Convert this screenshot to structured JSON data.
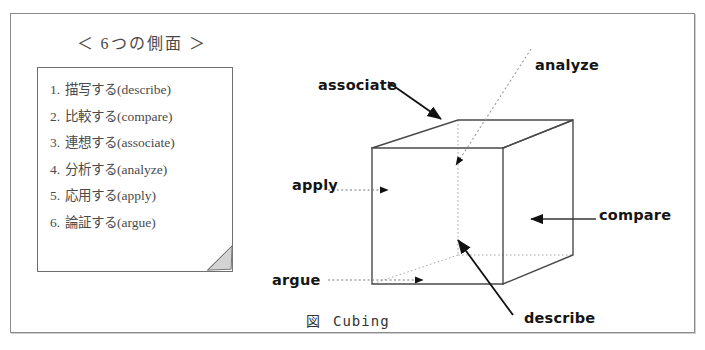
{
  "figure": {
    "caption_mark": "図",
    "caption_text": "Cubing",
    "technique": "Cubing"
  },
  "list_panel": {
    "title": "＜ 6つの側面 ＞",
    "items": [
      {
        "number": "1.",
        "ja": "描写する",
        "en": "(describe)"
      },
      {
        "number": "2.",
        "ja": "比較する",
        "en": "(compare)"
      },
      {
        "number": "3.",
        "ja": "連想する",
        "en": "(associate)"
      },
      {
        "number": "4.",
        "ja": "分析する",
        "en": "(analyze)"
      },
      {
        "number": "5.",
        "ja": "応用する",
        "en": "(apply)"
      },
      {
        "number": "6.",
        "ja": "論証する",
        "en": "(argue)"
      }
    ]
  },
  "cube_labels": {
    "associate": "associate",
    "analyze": "analyze",
    "apply": "apply",
    "compare": "compare",
    "argue": "argue",
    "describe": "describe"
  },
  "colors": {
    "ink": "#151515",
    "line": "#4a4a4a",
    "hidden_line": "#9a9a9a",
    "frame": "#8b8b8b",
    "paper": "#ffffff"
  }
}
